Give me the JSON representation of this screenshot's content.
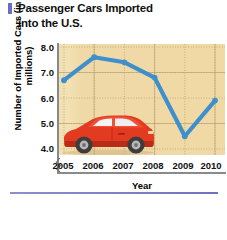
{
  "title": {
    "line1": "Passenger Cars Imported",
    "line2": "into the U.S.",
    "full": "Passenger Cars Imported into the U.S.",
    "accent_color": "#6b6fc4"
  },
  "chart_data": {
    "type": "line",
    "title": "Passenger Cars Imported into the U.S.",
    "xlabel": "Year",
    "ylabel": "Number of Imported Cars (in millions)",
    "categories": [
      "2005",
      "2006",
      "2007",
      "2008",
      "2009",
      "2010"
    ],
    "values": [
      6.7,
      7.6,
      7.4,
      6.8,
      4.5,
      5.9
    ],
    "series": [
      {
        "name": "Imported passenger cars",
        "values": [
          6.7,
          7.6,
          7.4,
          6.8,
          4.5,
          5.9
        ],
        "color": "#3f8fcc"
      }
    ],
    "ylim": [
      3.6,
      8.3
    ],
    "yticks": [
      "8.0",
      "7.0",
      "6.0",
      "5.0",
      "4.0"
    ],
    "ytick_values": [
      8.0,
      7.0,
      6.0,
      5.0,
      4.0
    ],
    "xticks": [
      "2005",
      "2006",
      "2007",
      "2008",
      "2009",
      "2010"
    ],
    "grid": true,
    "grid_style": "dotted",
    "legend": "none",
    "axis_break": true,
    "axis_break_axis": "y",
    "plot_background": "#efdcab",
    "line_color": "#3f8fcc",
    "marker": "dot",
    "annotations": [
      "red sports car illustration inside plot area"
    ]
  },
  "decor": {
    "car_body_color": "#e23b22",
    "car_window_color": "#f2f2f2",
    "car_wheel_color": "#4a4a4a",
    "bottom_rule_color": "#7a7ec3"
  }
}
